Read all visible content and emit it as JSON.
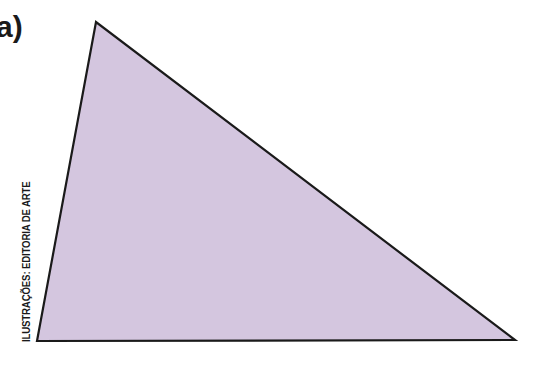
{
  "figure": {
    "item_label": "a)",
    "credit": "ILUSTRAÇÕES: EDITORIA DE ARTE",
    "shape": "triangle",
    "vertices": [
      [
        96,
        22
      ],
      [
        37,
        341
      ],
      [
        515,
        340
      ]
    ],
    "fill_color": "#d4c6df",
    "stroke_color": "#1a1a1a"
  }
}
